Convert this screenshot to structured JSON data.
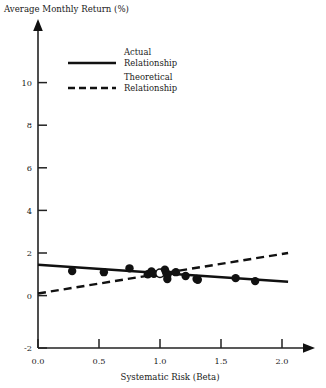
{
  "chart_data": {
    "type": "scatter",
    "title": "",
    "ylabel": "Average Monthly Return (%)",
    "xlabel": "Systematic Risk (Beta)",
    "xlim": [
      0.0,
      2.05
    ],
    "ylim": [
      -2,
      11.2
    ],
    "xticks": [
      0.0,
      0.5,
      1.0,
      1.5,
      2.0
    ],
    "xtick_labels": [
      "0.0",
      "0.5",
      "1.0",
      "1.5",
      "2.0"
    ],
    "yticks": [
      -2,
      0,
      2,
      4,
      6,
      8,
      10
    ],
    "ytick_labels": [
      "-2",
      "0",
      "2",
      "4",
      "6",
      "8",
      "10"
    ],
    "grid": false,
    "legend_position": "upper-center",
    "axis_style": "arrow-tipped-spines",
    "marker_color": "#111111",
    "line_color": "#111111",
    "points": [
      {
        "x": 0.28,
        "y": 1.15,
        "filled": true
      },
      {
        "x": 0.54,
        "y": 1.1,
        "filled": true
      },
      {
        "x": 0.75,
        "y": 1.28,
        "filled": true
      },
      {
        "x": 0.9,
        "y": 1.0,
        "filled": true
      },
      {
        "x": 0.93,
        "y": 1.13,
        "filled": true
      },
      {
        "x": 0.95,
        "y": 1.02,
        "filled": true
      },
      {
        "x": 1.0,
        "y": 1.05,
        "filled": false
      },
      {
        "x": 1.04,
        "y": 1.22,
        "filled": true
      },
      {
        "x": 1.05,
        "y": 1.08,
        "filled": true
      },
      {
        "x": 1.06,
        "y": 0.95,
        "filled": true
      },
      {
        "x": 1.06,
        "y": 0.78,
        "filled": true
      },
      {
        "x": 1.13,
        "y": 1.1,
        "filled": true
      },
      {
        "x": 1.21,
        "y": 0.92,
        "filled": true
      },
      {
        "x": 1.3,
        "y": 0.78,
        "filled": true
      },
      {
        "x": 1.31,
        "y": 0.74,
        "filled": true
      },
      {
        "x": 1.62,
        "y": 0.82,
        "filled": true
      },
      {
        "x": 1.78,
        "y": 0.68,
        "filled": true
      }
    ],
    "series": [
      {
        "name": "Actual Relationship",
        "type": "line",
        "style": "solid",
        "x": [
          0.0,
          2.05
        ],
        "y": [
          1.45,
          0.65
        ]
      },
      {
        "name": "Theoretical Relationship",
        "type": "line",
        "style": "dashed",
        "x": [
          0.0,
          2.05
        ],
        "y": [
          0.1,
          2.0
        ]
      }
    ]
  },
  "legend": {
    "entries": [
      {
        "label_line1": "Actual",
        "label_line2": "Relationship",
        "style": "solid"
      },
      {
        "label_line1": "Theoretical",
        "label_line2": "Relationship",
        "style": "dashed"
      }
    ]
  },
  "axes": {
    "y_title": "Average Monthly Return (%)",
    "x_title": "Systematic Risk (Beta)",
    "y_labels": [
      "10",
      "8",
      "6",
      "4",
      "2",
      "0",
      "-2"
    ],
    "x_labels": [
      "0.0",
      "0.5",
      "1.0",
      "1.5",
      "2.0"
    ]
  }
}
